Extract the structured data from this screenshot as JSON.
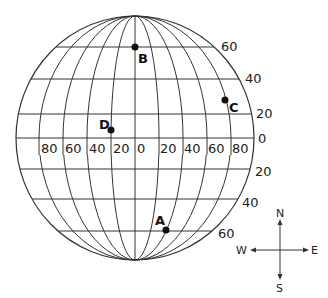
{
  "globe": {
    "center": [
      135,
      138
    ],
    "rx": 119,
    "ry": 122,
    "stroke_color": "#333333"
  },
  "latitude_lines": [
    {
      "lat": 60,
      "hem": "N",
      "y": 47
    },
    {
      "lat": 40,
      "hem": "N",
      "y": 79
    },
    {
      "lat": 20,
      "hem": "N",
      "y": 114
    },
    {
      "lat": 0,
      "hem": "",
      "y": 138
    },
    {
      "lat": 20,
      "hem": "S",
      "y": 169
    },
    {
      "lat": 40,
      "hem": "S",
      "y": 199
    },
    {
      "lat": 60,
      "hem": "S",
      "y": 231
    }
  ],
  "latitude_labels": {
    "n60": "60",
    "n40": "40",
    "n20": "20",
    "eq": "0",
    "s20": "20",
    "s40": "40",
    "s60": "60"
  },
  "longitude_labels": {
    "w80": "80",
    "w60": "60",
    "w40": "40",
    "w20": "20",
    "zero": "0",
    "e20": "20",
    "e40": "40",
    "e60": "60",
    "e80": "80"
  },
  "points": {
    "A": {
      "label": "A",
      "x": 166,
      "y": 230
    },
    "B": {
      "label": "B",
      "x": 135,
      "y": 47
    },
    "C": {
      "label": "C",
      "x": 225,
      "y": 100
    },
    "D": {
      "label": "D",
      "x": 110,
      "y": 129
    }
  },
  "compass": {
    "north": "N",
    "south": "S",
    "east": "E",
    "west": "W"
  }
}
